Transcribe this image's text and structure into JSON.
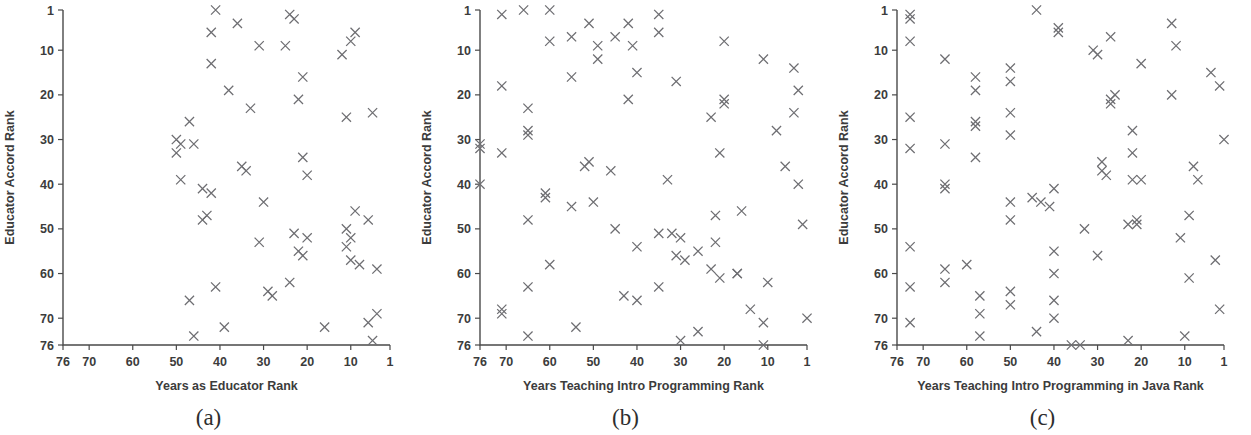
{
  "figure": {
    "panel_count": 3,
    "marker_symbol": "x",
    "marker_color": "#6e6e72",
    "axis_color": "#4a4a4a",
    "background_color": "#ffffff"
  },
  "panels": [
    {
      "caption": "(a)",
      "chart_data": {
        "type": "scatter",
        "title": "",
        "xlabel": "Years as Educator Rank",
        "ylabel": "Educator Accord Rank",
        "xlim": [
          76,
          1
        ],
        "ylim": [
          1,
          76
        ],
        "x_reversed": true,
        "y_reversed": true,
        "xticks": [
          76,
          70,
          60,
          50,
          40,
          30,
          20,
          10,
          1
        ],
        "yticks": [
          1,
          10,
          20,
          30,
          40,
          50,
          60,
          70,
          76
        ],
        "grid": false,
        "legend": "none",
        "points": [
          [
            41,
            1
          ],
          [
            24,
            2
          ],
          [
            23,
            3
          ],
          [
            36,
            4
          ],
          [
            42,
            6
          ],
          [
            9,
            6
          ],
          [
            10,
            8
          ],
          [
            31,
            9
          ],
          [
            25,
            9
          ],
          [
            12,
            11
          ],
          [
            42,
            13
          ],
          [
            21,
            16
          ],
          [
            38,
            19
          ],
          [
            33,
            23
          ],
          [
            22,
            21
          ],
          [
            11,
            25
          ],
          [
            5,
            24
          ],
          [
            47,
            26
          ],
          [
            50,
            30
          ],
          [
            49,
            31
          ],
          [
            46,
            31
          ],
          [
            50,
            33
          ],
          [
            21,
            34
          ],
          [
            35,
            36
          ],
          [
            34,
            37
          ],
          [
            20,
            38
          ],
          [
            49,
            39
          ],
          [
            44,
            41
          ],
          [
            42,
            42
          ],
          [
            43,
            47
          ],
          [
            30,
            44
          ],
          [
            9,
            46
          ],
          [
            44,
            48
          ],
          [
            6,
            48
          ],
          [
            11,
            50
          ],
          [
            23,
            51
          ],
          [
            10,
            52
          ],
          [
            20,
            52
          ],
          [
            31,
            53
          ],
          [
            11,
            54
          ],
          [
            22,
            55
          ],
          [
            21,
            56
          ],
          [
            10,
            57
          ],
          [
            8,
            58
          ],
          [
            4,
            59
          ],
          [
            41,
            63
          ],
          [
            29,
            64
          ],
          [
            28,
            65
          ],
          [
            24,
            62
          ],
          [
            47,
            66
          ],
          [
            39,
            72
          ],
          [
            16,
            72
          ],
          [
            6,
            71
          ],
          [
            4,
            69
          ],
          [
            46,
            74
          ],
          [
            5,
            75
          ]
        ]
      }
    },
    {
      "caption": "(b)",
      "chart_data": {
        "type": "scatter",
        "title": "",
        "xlabel": "Years Teaching Intro Programming Rank",
        "ylabel": "Educator Accord Rank",
        "xlim": [
          76,
          1
        ],
        "ylim": [
          1,
          76
        ],
        "x_reversed": true,
        "y_reversed": true,
        "xticks": [
          76,
          70,
          60,
          50,
          40,
          30,
          20,
          10,
          1
        ],
        "yticks": [
          1,
          10,
          20,
          30,
          40,
          50,
          60,
          70,
          76
        ],
        "grid": false,
        "legend": "none",
        "points": [
          [
            71,
            2
          ],
          [
            66,
            1
          ],
          [
            60,
            1
          ],
          [
            51,
            4
          ],
          [
            42,
            4
          ],
          [
            35,
            2
          ],
          [
            35,
            6
          ],
          [
            45,
            7
          ],
          [
            55,
            7
          ],
          [
            49,
            9
          ],
          [
            60,
            8
          ],
          [
            41,
            9
          ],
          [
            20,
            8
          ],
          [
            49,
            12
          ],
          [
            11,
            12
          ],
          [
            4,
            14
          ],
          [
            40,
            15
          ],
          [
            55,
            16
          ],
          [
            31,
            17
          ],
          [
            3,
            19
          ],
          [
            71,
            18
          ],
          [
            42,
            21
          ],
          [
            20,
            21
          ],
          [
            20,
            22
          ],
          [
            65,
            23
          ],
          [
            23,
            25
          ],
          [
            4,
            24
          ],
          [
            65,
            28
          ],
          [
            65,
            29
          ],
          [
            76,
            31
          ],
          [
            8,
            28
          ],
          [
            76,
            32
          ],
          [
            71,
            33
          ],
          [
            21,
            33
          ],
          [
            51,
            35
          ],
          [
            52,
            36
          ],
          [
            6,
            36
          ],
          [
            46,
            37
          ],
          [
            33,
            39
          ],
          [
            3,
            40
          ],
          [
            76,
            40
          ],
          [
            61,
            42
          ],
          [
            61,
            43
          ],
          [
            55,
            45
          ],
          [
            50,
            44
          ],
          [
            65,
            48
          ],
          [
            45,
            50
          ],
          [
            2,
            49
          ],
          [
            16,
            46
          ],
          [
            22,
            47
          ],
          [
            35,
            51
          ],
          [
            32,
            51
          ],
          [
            30,
            52
          ],
          [
            40,
            54
          ],
          [
            26,
            55
          ],
          [
            31,
            56
          ],
          [
            29,
            57
          ],
          [
            22,
            53
          ],
          [
            60,
            58
          ],
          [
            23,
            59
          ],
          [
            17,
            60
          ],
          [
            17,
            60
          ],
          [
            10,
            62
          ],
          [
            21,
            61
          ],
          [
            65,
            63
          ],
          [
            35,
            63
          ],
          [
            43,
            65
          ],
          [
            40,
            66
          ],
          [
            71,
            68
          ],
          [
            71,
            69
          ],
          [
            14,
            68
          ],
          [
            11,
            71
          ],
          [
            1,
            70
          ],
          [
            54,
            72
          ],
          [
            26,
            73
          ],
          [
            30,
            75
          ],
          [
            11,
            76
          ],
          [
            65,
            74
          ]
        ]
      }
    },
    {
      "caption": "(c)",
      "chart_data": {
        "type": "scatter",
        "title": "",
        "xlabel": "Years Teaching Intro Programming in Java Rank",
        "ylabel": "Educator Accord Rank",
        "xlim": [
          76,
          1
        ],
        "ylim": [
          1,
          76
        ],
        "x_reversed": true,
        "y_reversed": true,
        "xticks": [
          76,
          70,
          60,
          50,
          40,
          30,
          20,
          10,
          1
        ],
        "yticks": [
          1,
          10,
          20,
          30,
          40,
          50,
          60,
          70,
          76
        ],
        "grid": false,
        "legend": "none",
        "points": [
          [
            73,
            2
          ],
          [
            73,
            3
          ],
          [
            44,
            1
          ],
          [
            39,
            5
          ],
          [
            39,
            6
          ],
          [
            13,
            4
          ],
          [
            27,
            7
          ],
          [
            73,
            8
          ],
          [
            12,
            9
          ],
          [
            31,
            10
          ],
          [
            30,
            11
          ],
          [
            65,
            12
          ],
          [
            50,
            14
          ],
          [
            20,
            13
          ],
          [
            4,
            15
          ],
          [
            58,
            16
          ],
          [
            50,
            17
          ],
          [
            58,
            19
          ],
          [
            2,
            18
          ],
          [
            13,
            20
          ],
          [
            26,
            20
          ],
          [
            27,
            21
          ],
          [
            27,
            22
          ],
          [
            73,
            25
          ],
          [
            50,
            24
          ],
          [
            58,
            26
          ],
          [
            58,
            27
          ],
          [
            22,
            28
          ],
          [
            1,
            30
          ],
          [
            73,
            32
          ],
          [
            65,
            31
          ],
          [
            50,
            29
          ],
          [
            22,
            33
          ],
          [
            29,
            35
          ],
          [
            29,
            37
          ],
          [
            28,
            38
          ],
          [
            58,
            34
          ],
          [
            65,
            40
          ],
          [
            65,
            41
          ],
          [
            22,
            39
          ],
          [
            8,
            36
          ],
          [
            7,
            39
          ],
          [
            45,
            43
          ],
          [
            40,
            41
          ],
          [
            50,
            44
          ],
          [
            41,
            45
          ],
          [
            43,
            44
          ],
          [
            20,
            39
          ],
          [
            50,
            48
          ],
          [
            9,
            47
          ],
          [
            33,
            50
          ],
          [
            23,
            49
          ],
          [
            21,
            48
          ],
          [
            21,
            49
          ],
          [
            11,
            52
          ],
          [
            73,
            54
          ],
          [
            40,
            55
          ],
          [
            30,
            56
          ],
          [
            3,
            57
          ],
          [
            65,
            59
          ],
          [
            60,
            58
          ],
          [
            40,
            60
          ],
          [
            73,
            63
          ],
          [
            65,
            62
          ],
          [
            57,
            65
          ],
          [
            50,
            64
          ],
          [
            40,
            66
          ],
          [
            9,
            61
          ],
          [
            50,
            67
          ],
          [
            57,
            69
          ],
          [
            73,
            71
          ],
          [
            40,
            70
          ],
          [
            57,
            74
          ],
          [
            44,
            73
          ],
          [
            10,
            74
          ],
          [
            34,
            76
          ],
          [
            23,
            75
          ],
          [
            2,
            68
          ],
          [
            36,
            76
          ]
        ]
      }
    }
  ]
}
